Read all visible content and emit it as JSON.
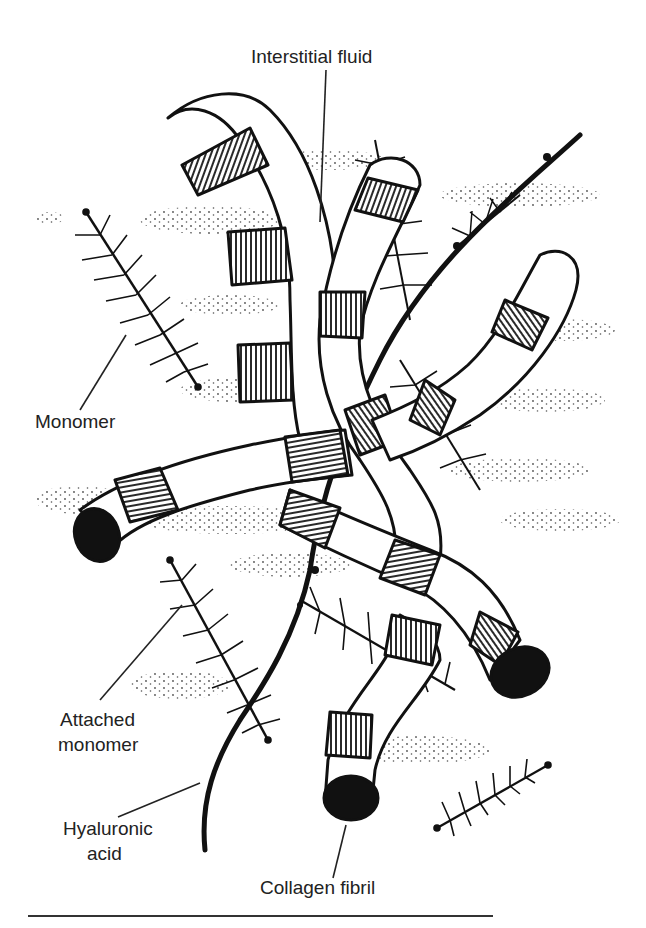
{
  "figure": {
    "labels": {
      "interstitial_fluid": "Interstitial fluid",
      "monomer": "Monomer",
      "attached_monomer_line1": "Attached",
      "attached_monomer_line2": "monomer",
      "hyaluronic_acid_line1": "Hyaluronic",
      "hyaluronic_acid_line2": "acid",
      "collagen_fibril": "Collagen fibril"
    },
    "colors": {
      "ink": "#111111",
      "background": "#ffffff",
      "label_text": "#222222"
    }
  }
}
